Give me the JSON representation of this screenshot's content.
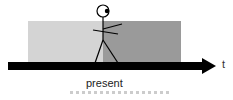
{
  "diagram": {
    "axis_label": "t",
    "present_label": "present",
    "regions": [
      {
        "name": "past",
        "color": "#d4d4d4"
      },
      {
        "name": "future",
        "color": "#9a9a9a"
      }
    ],
    "arrow_color": "#000000"
  }
}
